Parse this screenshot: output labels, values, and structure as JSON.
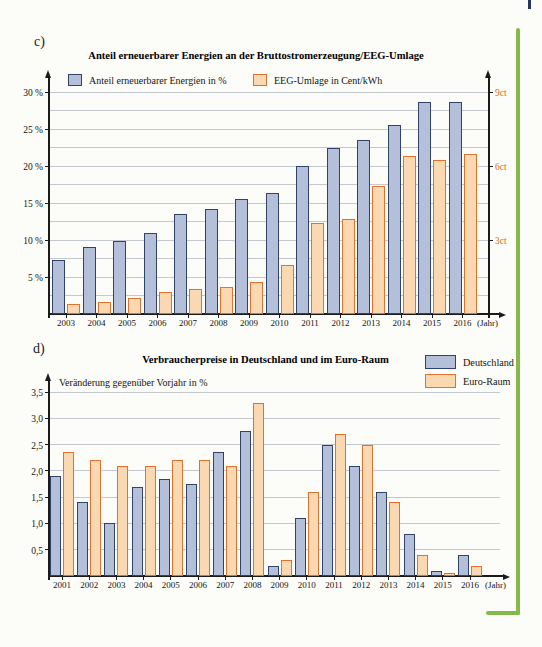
{
  "page": {
    "section_label_c": "c)",
    "section_label_d": "d)",
    "accent_green": "#85b94a",
    "bar_blue_fill": "#b4c0d9",
    "bar_blue_border": "#31436b",
    "bar_orange_fill": "#fad9b2",
    "bar_orange_border": "#e1722e",
    "right_axis_text_color": "#e2691c"
  },
  "chart_data": [
    {
      "id": "chart-c",
      "type": "bar",
      "title": "Anteil erneuerbarer Energien an der Bruttostromerzeugung/EEG-Umlage",
      "categories": [
        "2003",
        "2004",
        "2005",
        "2006",
        "2007",
        "2008",
        "2009",
        "2010",
        "2011",
        "2012",
        "2013",
        "2014",
        "2015",
        "2016"
      ],
      "x_axis_suffix": "(Jahr)",
      "series": [
        {
          "name": "Anteil erneuerbarer Energien in %",
          "axis": "left",
          "fill": "#b4c0d9",
          "border": "#31436b",
          "values": [
            7.3,
            9.0,
            9.9,
            11.0,
            13.5,
            14.2,
            15.6,
            16.3,
            20.0,
            22.4,
            23.5,
            25.5,
            28.7,
            28.7
          ]
        },
        {
          "name": "EEG-Umlage in Cent/kWh",
          "axis": "right",
          "fill": "#fad9b2",
          "border": "#e1722e",
          "values": [
            0.4,
            0.5,
            0.65,
            0.9,
            1.0,
            1.1,
            1.3,
            2.0,
            3.7,
            3.85,
            5.2,
            6.4,
            6.25,
            6.5
          ]
        }
      ],
      "left_axis": {
        "max": 30,
        "minor_step": 2.5,
        "ticks": [
          {
            "v": 5,
            "label": "5 %"
          },
          {
            "v": 10,
            "label": "10 %"
          },
          {
            "v": 15,
            "label": "15 %"
          },
          {
            "v": 20,
            "label": "20 %"
          },
          {
            "v": 25,
            "label": "25 %"
          },
          {
            "v": 30,
            "label": "30 %"
          }
        ]
      },
      "right_axis": {
        "max": 9,
        "color": "#e2691c",
        "ticks": [
          {
            "v": 3,
            "label": "3ct"
          },
          {
            "v": 6,
            "label": "6ct"
          },
          {
            "v": 9,
            "label": "9ct"
          }
        ]
      },
      "grid": true,
      "legend_position": "top-inline"
    },
    {
      "id": "chart-d",
      "type": "bar",
      "title": "Verbraucherpreise in Deutschland und im Euro-Raum",
      "y_axis_label": "Veränderung gegenüber Vorjahr in %",
      "categories": [
        "2001",
        "2002",
        "2003",
        "2004",
        "2005",
        "2006",
        "2007",
        "2008",
        "2009",
        "2010",
        "2011",
        "2012",
        "2013",
        "2014",
        "2015",
        "2016"
      ],
      "x_axis_suffix": "(Jahr)",
      "series": [
        {
          "name": "Deutschland",
          "axis": "left",
          "fill": "#b4c0d9",
          "border": "#31436b",
          "values": [
            1.9,
            1.4,
            1.0,
            1.7,
            1.85,
            1.75,
            2.35,
            2.75,
            0.2,
            1.1,
            2.5,
            2.1,
            1.6,
            0.8,
            0.1,
            0.4
          ]
        },
        {
          "name": "Euro-Raum",
          "axis": "left",
          "fill": "#fad9b2",
          "border": "#e1722e",
          "values": [
            2.35,
            2.2,
            2.1,
            2.1,
            2.2,
            2.2,
            2.1,
            3.3,
            0.3,
            1.6,
            2.7,
            2.5,
            1.4,
            0.4,
            0.05,
            0.2
          ]
        }
      ],
      "left_axis": {
        "max": 3.5,
        "minor_step": 0.5,
        "ticks": [
          {
            "v": 0.5,
            "label": "0,5"
          },
          {
            "v": 1.0,
            "label": "1,0"
          },
          {
            "v": 1.5,
            "label": "1,5"
          },
          {
            "v": 2.0,
            "label": "2,0"
          },
          {
            "v": 2.5,
            "label": "2,5"
          },
          {
            "v": 3.0,
            "label": "3,0"
          },
          {
            "v": 3.5,
            "label": "3,5"
          }
        ]
      },
      "grid": true,
      "legend_position": "top-right-box"
    }
  ]
}
